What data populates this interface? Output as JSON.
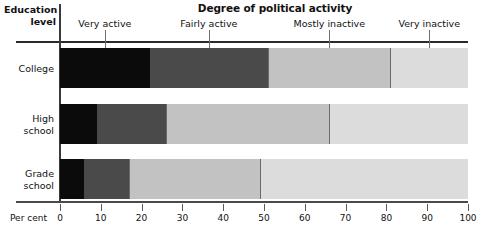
{
  "chart_data": {
    "type": "bar",
    "orientation": "horizontal",
    "stacked": true,
    "title": "Degree of political activity",
    "xlabel": "Per cent",
    "ylabel": "Education level",
    "xlim": [
      0,
      100
    ],
    "grid": false,
    "legend_position": "top",
    "categories": [
      "College",
      "High school",
      "Grade school"
    ],
    "series": [
      {
        "name": "Very active",
        "color": "#0b0b0b",
        "values": [
          22,
          9,
          6
        ]
      },
      {
        "name": "Fairly active",
        "color": "#4a4a4a",
        "values": [
          29,
          17,
          11
        ]
      },
      {
        "name": "Mostly inactive",
        "color": "#c2c2c2",
        "values": [
          30,
          40,
          32
        ]
      },
      {
        "name": "Very inactive",
        "color": "#dcdcdc",
        "values": [
          19,
          34,
          51
        ]
      }
    ],
    "xticks": [
      0,
      10,
      20,
      30,
      40,
      50,
      60,
      70,
      80,
      90,
      100
    ],
    "xtick_labels": [
      "0",
      "10",
      "20",
      "30",
      "40",
      "50",
      "60",
      "70",
      "80",
      "90",
      "100"
    ]
  },
  "title": {
    "text": "Degree of political activity"
  },
  "corner": {
    "line1": "Education",
    "line2": "level"
  },
  "legend": {
    "items": [
      {
        "label": "Very active"
      },
      {
        "label": "Fairly active"
      },
      {
        "label": "Mostly inactive"
      },
      {
        "label": "Very inactive"
      }
    ]
  },
  "rows": [
    {
      "line1": "College",
      "line2": ""
    },
    {
      "line1": "High",
      "line2": "school"
    },
    {
      "line1": "Grade",
      "line2": "school"
    }
  ],
  "xaxis": {
    "name": "Per cent",
    "labels": [
      "0",
      "10",
      "20",
      "30",
      "40",
      "50",
      "60",
      "70",
      "80",
      "90",
      "100"
    ]
  }
}
